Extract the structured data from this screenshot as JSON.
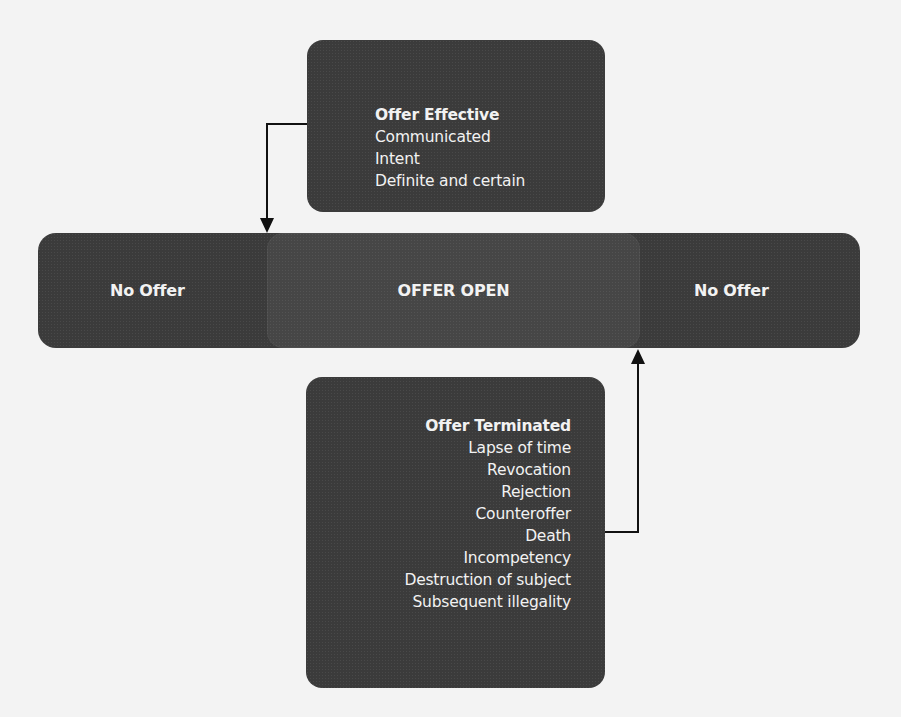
{
  "diagram": {
    "offer_effective": {
      "title": "Offer Effective",
      "items": [
        "Communicated",
        "Intent",
        "Definite and certain"
      ]
    },
    "timeline": {
      "left_label": "No Offer",
      "center_label": "OFFER OPEN",
      "right_label": "No Offer"
    },
    "offer_terminated": {
      "title": "Offer Terminated",
      "items": [
        "Lapse of time",
        "Revocation",
        "Rejection",
        "Counteroffer",
        "Death",
        "Incompetency",
        "Destruction of subject",
        "Subsequent illegality"
      ]
    },
    "colors": {
      "box": "#3b3b3b",
      "text": "#f2f2f2",
      "background": "#f3f3f3",
      "connector": "#111111"
    }
  }
}
